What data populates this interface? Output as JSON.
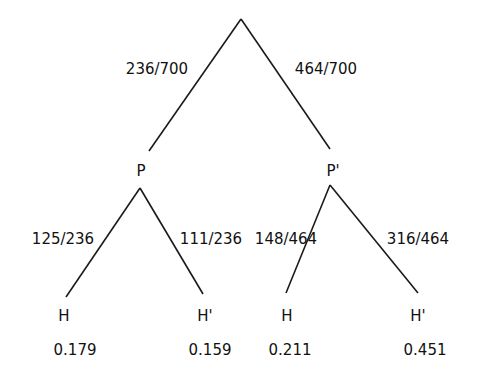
{
  "diagram": {
    "type": "probability-tree",
    "root": {
      "branches": [
        {
          "probability": "236/700",
          "node": "P",
          "branches": [
            {
              "probability": "125/236",
              "node": "H",
              "joint": "0.179"
            },
            {
              "probability": "111/236",
              "node": "H'",
              "joint": "0.159"
            }
          ]
        },
        {
          "probability": "464/700",
          "node": "P'",
          "branches": [
            {
              "probability": "148/464",
              "node": "H",
              "joint": "0.211"
            },
            {
              "probability": "316/464",
              "node": "H'",
              "joint": "0.451"
            }
          ]
        }
      ]
    }
  },
  "labels": {
    "edge_root_p": "236/700",
    "edge_root_pprime": "464/700",
    "node_p": "P",
    "node_pprime": "P'",
    "edge_p_h": "125/236",
    "edge_p_hprime": "111/236",
    "edge_pprime_h": "148/464",
    "edge_pprime_hprime": "316/464",
    "leaf1_node": "H",
    "leaf2_node": "H'",
    "leaf3_node": "H",
    "leaf4_node": "H'",
    "leaf1_value": "0.179",
    "leaf2_value": "0.159",
    "leaf3_value": "0.211",
    "leaf4_value": "0.451"
  }
}
